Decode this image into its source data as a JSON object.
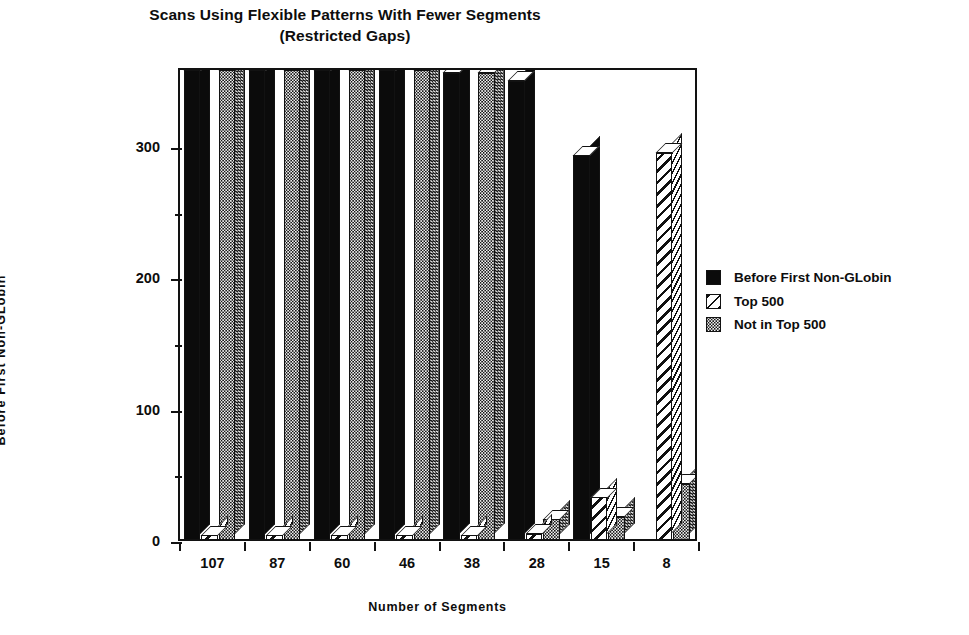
{
  "chart_data": {
    "type": "bar",
    "title": "Scans Using Flexible Patterns With Fewer Segments (Restricted Gaps)",
    "title_line1": "Scans Using Flexible Patterns With Fewer Segments",
    "title_line2": "(Restricted Gaps)",
    "xlabel": "Number of Segments",
    "ylabel": "Before  First  Non-GLobin",
    "categories": [
      "107",
      "87",
      "60",
      "46",
      "38",
      "28",
      "15",
      "8"
    ],
    "series": [
      {
        "name": "Before First Non-GLobin",
        "pattern": "solid-black",
        "color": "#0b0b0b",
        "values": [
          360,
          360,
          360,
          360,
          358,
          352,
          295,
          0
        ]
      },
      {
        "name": "Top 500",
        "pattern": "diagonal-hatch",
        "color": "#ffffff",
        "values": [
          6,
          6,
          6,
          6,
          6,
          7,
          35,
          297
        ]
      },
      {
        "name": "Not in Top 500",
        "pattern": "stipple-gray",
        "color": "#f2f2f2",
        "values": [
          360,
          360,
          360,
          360,
          358,
          18,
          20,
          45
        ]
      }
    ],
    "ylim": [
      0,
      360
    ],
    "y_major_ticks": [
      0,
      100,
      200,
      300
    ],
    "y_minor_ticks": [
      50,
      150,
      250
    ],
    "ytick_labels": [
      "0",
      "100",
      "200",
      "300"
    ],
    "grid": false,
    "legend_position": "right",
    "style": "3d-isometric-bars",
    "note": "Bars exceeding the plot top are clipped by the frame"
  },
  "legend": {
    "items": [
      {
        "label": "Before First Non-GLobin",
        "swatch": "solid-black"
      },
      {
        "label": "Top 500",
        "swatch": "diagonal-hatch"
      },
      {
        "label": "Not in Top 500",
        "swatch": "stipple-gray"
      }
    ]
  }
}
